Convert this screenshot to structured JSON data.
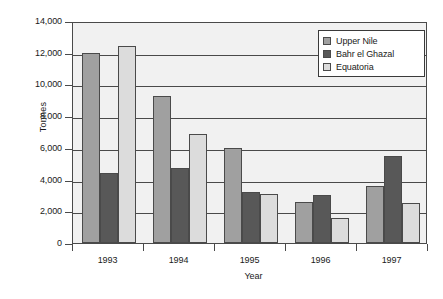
{
  "chart_data": {
    "type": "bar",
    "title": "",
    "xlabel": "Year",
    "ylabel": "Tonnes",
    "categories": [
      "1993",
      "1994",
      "1995",
      "1996",
      "1997"
    ],
    "series": [
      {
        "name": "Upper Nile",
        "color": "#a0a0a0",
        "values": [
          12000,
          9300,
          6000,
          2600,
          3600
        ]
      },
      {
        "name": "Bahr el Ghazal",
        "color": "#585858",
        "values": [
          4400,
          4700,
          3200,
          3000,
          5500
        ]
      },
      {
        "name": "Equatoria",
        "color": "#dcdcdc",
        "values": [
          12400,
          6900,
          3100,
          1600,
          2500
        ]
      }
    ],
    "ylim": [
      0,
      14000
    ],
    "ytick_values": [
      0,
      2000,
      4000,
      6000,
      8000,
      10000,
      12000,
      14000
    ],
    "ytick_labels": [
      "0",
      "2,000",
      "4,000",
      "6,000",
      "8,000",
      "10,000",
      "12,000",
      "14,000"
    ],
    "grid": true,
    "legend_position": "top-right",
    "plot_background": "#f1f1f1",
    "axis_color": "#4a4a4a"
  }
}
